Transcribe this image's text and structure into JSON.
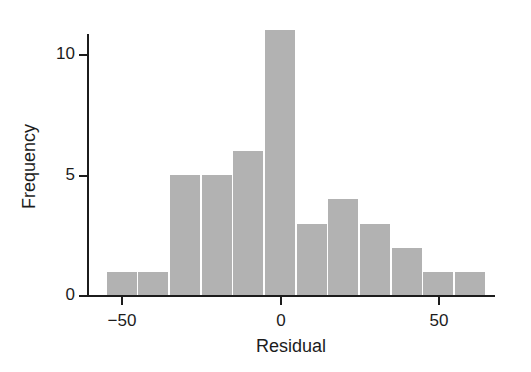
{
  "chart_data": {
    "type": "bar",
    "title": "",
    "subtitle": "",
    "xlabel": "Residual",
    "ylabel": "Frequency",
    "bin_width": 10,
    "bin_edges": [
      -55,
      -45,
      -35,
      -25,
      -15,
      -5,
      5,
      15,
      25,
      35,
      45,
      55,
      65
    ],
    "categories": [
      "-55 to -45",
      "-45 to -35",
      "-35 to -25",
      "-25 to -15",
      "-15 to -5",
      "-5 to 5",
      "5 to 15",
      "15 to 25",
      "25 to 35",
      "35 to 45",
      "45 to 55",
      "55 to 65"
    ],
    "bin_centers": [
      -50,
      -40,
      -30,
      -20,
      -10,
      0,
      10,
      20,
      30,
      40,
      50,
      60
    ],
    "values": [
      1,
      1,
      5,
      5,
      6,
      11,
      3,
      4,
      3,
      2,
      1,
      1
    ],
    "xlim": [
      -62,
      67
    ],
    "ylim": [
      0,
      11.5
    ],
    "x_ticks": [
      -50,
      0,
      50
    ],
    "x_tick_labels": [
      "−50",
      "0",
      "50"
    ],
    "y_ticks": [
      0,
      5,
      10
    ],
    "y_tick_labels": [
      "0",
      "5",
      "10"
    ],
    "grid": false,
    "legend": "none",
    "bar_color": "#b2b2b2",
    "axis_color": "#1c1c1c",
    "background_color": "#ffffff"
  }
}
